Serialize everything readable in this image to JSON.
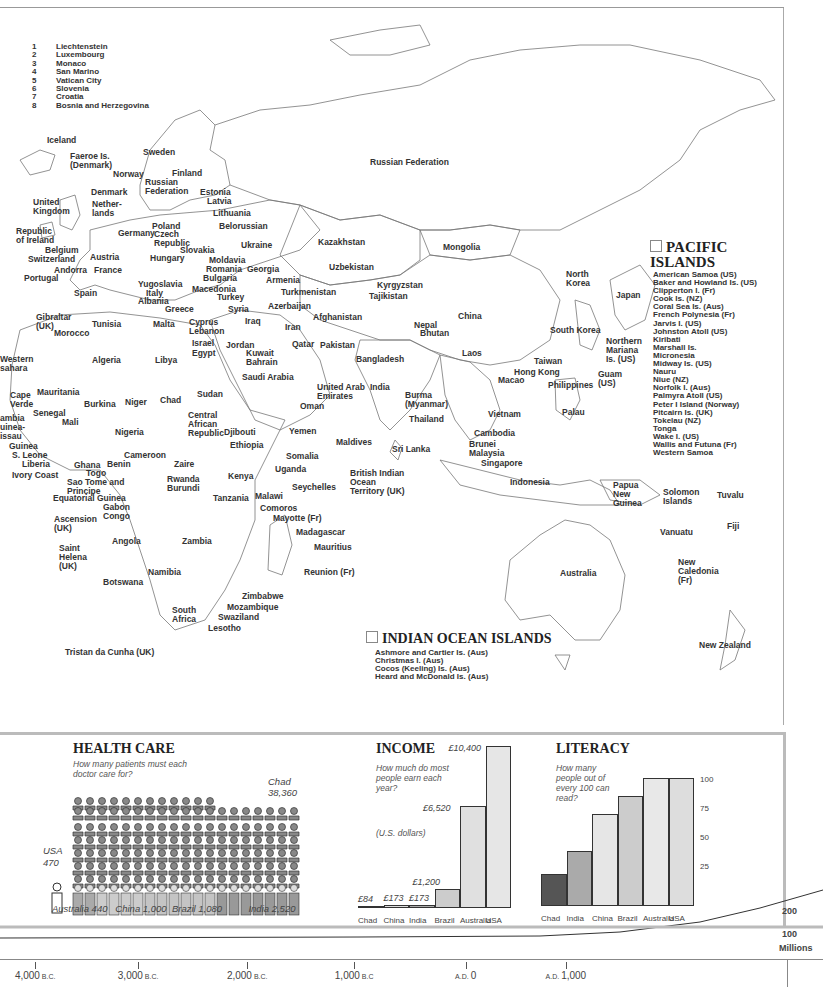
{
  "map": {
    "key_list": [
      {
        "num": "1",
        "name": "Liechtenstein"
      },
      {
        "num": "2",
        "name": "Luxembourg"
      },
      {
        "num": "3",
        "name": "Monaco"
      },
      {
        "num": "4",
        "name": "San Marino"
      },
      {
        "num": "5",
        "name": "Vatican City"
      },
      {
        "num": "6",
        "name": "Slovenia"
      },
      {
        "num": "7",
        "name": "Croatia"
      },
      {
        "num": "8",
        "name": "Bosnia and Herzegovina"
      }
    ],
    "labels": [
      {
        "t": "Iceland",
        "x": 47,
        "y": 136
      },
      {
        "t": "Faeroe Is.\n(Denmark)",
        "x": 70,
        "y": 152
      },
      {
        "t": "Sweden",
        "x": 143,
        "y": 148
      },
      {
        "t": "Norway",
        "x": 113,
        "y": 170
      },
      {
        "t": "Finland",
        "x": 172,
        "y": 169
      },
      {
        "t": "Russian\nFederation",
        "x": 145,
        "y": 178
      },
      {
        "t": "Estonia",
        "x": 200,
        "y": 188
      },
      {
        "t": "Denmark",
        "x": 91,
        "y": 188
      },
      {
        "t": "Latvia",
        "x": 207,
        "y": 197
      },
      {
        "t": "United\nKingdom",
        "x": 33,
        "y": 198
      },
      {
        "t": "Nether-\nlands",
        "x": 92,
        "y": 200
      },
      {
        "t": "Lithuania",
        "x": 213,
        "y": 209
      },
      {
        "t": "Poland",
        "x": 152,
        "y": 222
      },
      {
        "t": "Belorussian",
        "x": 219,
        "y": 222
      },
      {
        "t": "Republic\nof Ireland",
        "x": 16,
        "y": 227
      },
      {
        "t": "Germany",
        "x": 118,
        "y": 229
      },
      {
        "t": "Czech\nRepublic",
        "x": 154,
        "y": 230
      },
      {
        "t": "Belgium",
        "x": 45,
        "y": 246
      },
      {
        "t": "Slovakia",
        "x": 180,
        "y": 246
      },
      {
        "t": "Ukraine",
        "x": 241,
        "y": 241
      },
      {
        "t": "Switzerland",
        "x": 28,
        "y": 255
      },
      {
        "t": "Austria",
        "x": 90,
        "y": 253
      },
      {
        "t": "Hungary",
        "x": 150,
        "y": 254
      },
      {
        "t": "Moldavia",
        "x": 209,
        "y": 256
      },
      {
        "t": "Andorra",
        "x": 54,
        "y": 266
      },
      {
        "t": "France",
        "x": 94,
        "y": 266
      },
      {
        "t": "Romania",
        "x": 206,
        "y": 265
      },
      {
        "t": "Georgia",
        "x": 247,
        "y": 265
      },
      {
        "t": "Portugal",
        "x": 24,
        "y": 274
      },
      {
        "t": "Bulgaria",
        "x": 203,
        "y": 274
      },
      {
        "t": "Yugoslavia",
        "x": 138,
        "y": 280
      },
      {
        "t": "Armenia",
        "x": 266,
        "y": 276
      },
      {
        "t": "Macedonia",
        "x": 192,
        "y": 285
      },
      {
        "t": "Spain",
        "x": 74,
        "y": 289
      },
      {
        "t": "Italy",
        "x": 146,
        "y": 289
      },
      {
        "t": "Turkey",
        "x": 217,
        "y": 293
      },
      {
        "t": "Azerbaijan",
        "x": 268,
        "y": 302
      },
      {
        "t": "Albania",
        "x": 138,
        "y": 297
      },
      {
        "t": "Greece",
        "x": 165,
        "y": 305
      },
      {
        "t": "Syria",
        "x": 228,
        "y": 305
      },
      {
        "t": "Gibraltar\n(UK)",
        "x": 36,
        "y": 313
      },
      {
        "t": "Tunisia",
        "x": 92,
        "y": 320
      },
      {
        "t": "Malta",
        "x": 153,
        "y": 320
      },
      {
        "t": "Cyprus\nLebanon",
        "x": 189,
        "y": 318
      },
      {
        "t": "Iraq",
        "x": 245,
        "y": 317
      },
      {
        "t": "Morocco",
        "x": 54,
        "y": 329
      },
      {
        "t": "Israel",
        "x": 192,
        "y": 339
      },
      {
        "t": "Jordan",
        "x": 226,
        "y": 341
      },
      {
        "t": "Egypt",
        "x": 192,
        "y": 349
      },
      {
        "t": "Kuwait\nBahrain",
        "x": 246,
        "y": 349
      },
      {
        "t": "Western\nsahara",
        "x": 0,
        "y": 355
      },
      {
        "t": "Algeria",
        "x": 92,
        "y": 356
      },
      {
        "t": "Libya",
        "x": 155,
        "y": 356
      },
      {
        "t": "Saudi Arabia",
        "x": 242,
        "y": 373
      },
      {
        "t": "Mauritania",
        "x": 37,
        "y": 388
      },
      {
        "t": "Sudan",
        "x": 197,
        "y": 390
      },
      {
        "t": "Cape\nVerde",
        "x": 10,
        "y": 391
      },
      {
        "t": "Burkina",
        "x": 84,
        "y": 400
      },
      {
        "t": "Niger",
        "x": 125,
        "y": 398
      },
      {
        "t": "Chad",
        "x": 160,
        "y": 396
      },
      {
        "t": "Senegal",
        "x": 33,
        "y": 409
      },
      {
        "t": "ambia\nuinea-\nissau",
        "x": 0,
        "y": 414
      },
      {
        "t": "Mali",
        "x": 62,
        "y": 418
      },
      {
        "t": "Central\nAfrican\nRepublic",
        "x": 188,
        "y": 411
      },
      {
        "t": "Nigeria",
        "x": 115,
        "y": 428
      },
      {
        "t": "Djibouti",
        "x": 224,
        "y": 428
      },
      {
        "t": "Guinea",
        "x": 9,
        "y": 442
      },
      {
        "t": "Ethiopia",
        "x": 230,
        "y": 441
      },
      {
        "t": "S. Leone",
        "x": 12,
        "y": 451
      },
      {
        "t": "Cameroon",
        "x": 124,
        "y": 451
      },
      {
        "t": "Liberia",
        "x": 22,
        "y": 460
      },
      {
        "t": "Ghana",
        "x": 74,
        "y": 461
      },
      {
        "t": "Benin",
        "x": 107,
        "y": 460
      },
      {
        "t": "Zaire",
        "x": 174,
        "y": 460
      },
      {
        "t": "Ivory Coast",
        "x": 12,
        "y": 471
      },
      {
        "t": "Togo",
        "x": 86,
        "y": 469
      },
      {
        "t": "Sao Tome and\nPrincipe",
        "x": 67,
        "y": 478
      },
      {
        "t": "Rwanda\nBurundi",
        "x": 167,
        "y": 475
      },
      {
        "t": "Kenya",
        "x": 228,
        "y": 472
      },
      {
        "t": "Tanzania",
        "x": 213,
        "y": 494
      },
      {
        "t": "Malawi",
        "x": 255,
        "y": 492
      },
      {
        "t": "Equatorial Guinea",
        "x": 53,
        "y": 494
      },
      {
        "t": "Gabon\nCongo",
        "x": 103,
        "y": 503
      },
      {
        "t": "Comoros",
        "x": 260,
        "y": 504
      },
      {
        "t": "Mayotte (Fr)",
        "x": 273,
        "y": 514
      },
      {
        "t": "Ascension\n(UK)",
        "x": 54,
        "y": 515
      },
      {
        "t": "Angola",
        "x": 112,
        "y": 537
      },
      {
        "t": "Zambia",
        "x": 182,
        "y": 537
      },
      {
        "t": "Madagascar",
        "x": 296,
        "y": 528
      },
      {
        "t": "Mauritius",
        "x": 314,
        "y": 543
      },
      {
        "t": "Saint\nHelena\n(UK)",
        "x": 59,
        "y": 544
      },
      {
        "t": "Namibia",
        "x": 148,
        "y": 568
      },
      {
        "t": "Reunion (Fr)",
        "x": 304,
        "y": 568
      },
      {
        "t": "Botswana",
        "x": 103,
        "y": 578
      },
      {
        "t": "Zimbabwe",
        "x": 242,
        "y": 592
      },
      {
        "t": "South\nAfrica",
        "x": 172,
        "y": 606
      },
      {
        "t": "Mozambique",
        "x": 227,
        "y": 603
      },
      {
        "t": "Swaziland",
        "x": 218,
        "y": 613
      },
      {
        "t": "Lesotho",
        "x": 208,
        "y": 624
      },
      {
        "t": "Tristan da Cunha (UK)",
        "x": 65,
        "y": 648
      },
      {
        "t": "Russian Federation",
        "x": 370,
        "y": 158
      },
      {
        "t": "Kazakhstan",
        "x": 318,
        "y": 238
      },
      {
        "t": "Mongolia",
        "x": 443,
        "y": 243
      },
      {
        "t": "Uzbekistan",
        "x": 329,
        "y": 263
      },
      {
        "t": "Kyrgyzstan",
        "x": 377,
        "y": 281
      },
      {
        "t": "Turkmenistan",
        "x": 281,
        "y": 288
      },
      {
        "t": "Tajikistan",
        "x": 369,
        "y": 292
      },
      {
        "t": "Afghanistan",
        "x": 313,
        "y": 313
      },
      {
        "t": "Iran",
        "x": 285,
        "y": 323
      },
      {
        "t": "Qatar",
        "x": 292,
        "y": 340
      },
      {
        "t": "Pakistan",
        "x": 320,
        "y": 341
      },
      {
        "t": "Nepal",
        "x": 414,
        "y": 321
      },
      {
        "t": "Bhutan",
        "x": 420,
        "y": 329
      },
      {
        "t": "China",
        "x": 458,
        "y": 312
      },
      {
        "t": "Bangladesh",
        "x": 356,
        "y": 355
      },
      {
        "t": "India",
        "x": 370,
        "y": 383
      },
      {
        "t": "United Arab\nEmirates",
        "x": 317,
        "y": 383
      },
      {
        "t": "Oman",
        "x": 300,
        "y": 402
      },
      {
        "t": "Yemen",
        "x": 289,
        "y": 427
      },
      {
        "t": "Somalia",
        "x": 286,
        "y": 452
      },
      {
        "t": "Uganda",
        "x": 275,
        "y": 465
      },
      {
        "t": "Maldives",
        "x": 336,
        "y": 438
      },
      {
        "t": "Sri Lanka",
        "x": 392,
        "y": 445
      },
      {
        "t": "British Indian\nOcean\nTerritory (UK)",
        "x": 350,
        "y": 469
      },
      {
        "t": "Seychelles",
        "x": 292,
        "y": 483
      },
      {
        "t": "Burma\n(Myanmar)",
        "x": 405,
        "y": 391
      },
      {
        "t": "Thailand",
        "x": 409,
        "y": 415
      },
      {
        "t": "Laos",
        "x": 462,
        "y": 349
      },
      {
        "t": "Vietnam",
        "x": 488,
        "y": 410
      },
      {
        "t": "Cambodia",
        "x": 474,
        "y": 429
      },
      {
        "t": "Brunei\nMalaysia",
        "x": 469,
        "y": 440
      },
      {
        "t": "Singapore",
        "x": 481,
        "y": 459
      },
      {
        "t": "Indonesia",
        "x": 510,
        "y": 478
      },
      {
        "t": "North\nKorea",
        "x": 566,
        "y": 270
      },
      {
        "t": "Japan",
        "x": 616,
        "y": 291
      },
      {
        "t": "South Korea",
        "x": 550,
        "y": 326
      },
      {
        "t": "Taiwan",
        "x": 534,
        "y": 357
      },
      {
        "t": "Hong Kong",
        "x": 514,
        "y": 368
      },
      {
        "t": "Macao",
        "x": 498,
        "y": 376
      },
      {
        "t": "Philippines",
        "x": 548,
        "y": 381
      },
      {
        "t": "Northern\nMariana\nIs. (US)",
        "x": 606,
        "y": 337
      },
      {
        "t": "Guam\n(US)",
        "x": 598,
        "y": 370
      },
      {
        "t": "Palau",
        "x": 562,
        "y": 408
      },
      {
        "t": "Papua\nNew\nGuinea",
        "x": 613,
        "y": 481
      },
      {
        "t": "Solomon\nIslands",
        "x": 663,
        "y": 488
      },
      {
        "t": "Tuvalu",
        "x": 717,
        "y": 491
      },
      {
        "t": "Vanuatu",
        "x": 660,
        "y": 528
      },
      {
        "t": "Fiji",
        "x": 727,
        "y": 522
      },
      {
        "t": "New\nCaledonia\n(Fr)",
        "x": 678,
        "y": 558
      },
      {
        "t": "Australia",
        "x": 560,
        "y": 569
      },
      {
        "t": "New Zealand",
        "x": 699,
        "y": 641
      }
    ],
    "pacific": {
      "title_line1": "PACIFIC",
      "title_line2": "ISLANDS",
      "items": [
        "American Samoa (US)",
        "Baker and Howland Is. (US)",
        "Clipperton I. (Fr)",
        "Cook Is. (NZ)",
        "Coral Sea Is. (Aus)",
        "French Polynesia (Fr)",
        "Jarvis I. (US)",
        "Johnston Atoll (US)",
        "Kiribati",
        "Marshall Is.",
        "Micronesia",
        "Midway Is. (US)",
        "Nauru",
        "Niue (NZ)",
        "Norfolk I. (Aus)",
        "Palmyra Atoll (US)",
        "Peter I Island (Norway)",
        "Pitcairn Is. (UK)",
        "Tokelau (NZ)",
        "Tonga",
        "Wake I. (US)",
        "Wallis and Futuna (Fr)",
        "Western Samoa"
      ]
    },
    "indian_ocean": {
      "title": "INDIAN OCEAN ISLANDS",
      "items": [
        "Ashmore and Cartier Is. (Aus)",
        "Christmas I. (Aus)",
        "Cocos (Keeling) Is. (Aus)",
        "Heard and McDonald Is. (Aus)"
      ]
    }
  },
  "health": {
    "title": "HEALTH CARE",
    "question": "How many patients must each doctor   care for?",
    "label_chad": "Chad\n38,360",
    "label_usa": "USA\n470",
    "bottom_labels": "Australia 440   China 1,000  Brazil 1,080          India 2,520"
  },
  "income": {
    "title": "INCOME",
    "question": "How much do most people earn each year?",
    "unit": "(U.S. dollars)"
  },
  "literacy": {
    "title": "LITERACY",
    "question": "How many people out of every 100 can read?",
    "axis": [
      "100",
      "75",
      "50",
      "25"
    ]
  },
  "population": {
    "label_200": "200",
    "label_100": "100",
    "label_unit": "Millions",
    "ticks": [
      {
        "num": "4,000",
        "era": "B.C.",
        "x": 8
      },
      {
        "num": "3,000",
        "era": "B.C.",
        "x": 95
      },
      {
        "num": "2,000",
        "era": "B.C.",
        "x": 183
      },
      {
        "num": "1,000",
        "era": "B.C",
        "x": 270
      },
      {
        "num": "0",
        "era": "A.D.",
        "x": 367,
        "era_first": true
      },
      {
        "num": "1,000",
        "era": "A.D.",
        "x": 440,
        "era_first": true
      }
    ]
  },
  "chart_data": [
    {
      "type": "bar",
      "title": "HEALTH CARE",
      "subtitle": "How many patients must each doctor care for?",
      "categories": [
        "USA",
        "Australia",
        "China",
        "Brazil",
        "India",
        "Chad"
      ],
      "values": [
        470,
        440,
        1000,
        1080,
        2520,
        38360
      ],
      "ylabel": "Patients per doctor",
      "style": "pictogram"
    },
    {
      "type": "bar",
      "title": "INCOME",
      "subtitle": "How much do most people earn each year? (U.S. dollars)",
      "categories": [
        "Chad",
        "China",
        "India",
        "Brazil",
        "Australia",
        "USA"
      ],
      "values": [
        84,
        173,
        173,
        1200,
        6520,
        10400
      ],
      "value_labels": [
        "£84",
        "£173",
        "£173",
        "£1,200",
        "£6,520",
        "£10,400"
      ],
      "colors": [
        "#555555",
        "#dddddd",
        "#aaaaaa",
        "#cccccc",
        "#e0e0e0",
        "#e6e6e6"
      ]
    },
    {
      "type": "bar",
      "title": "LITERACY",
      "subtitle": "How many people out of every 100 can read?",
      "categories": [
        "Chad",
        "India",
        "China",
        "Brazil",
        "Australia",
        "USA"
      ],
      "values": [
        25,
        43,
        72,
        86,
        100,
        100
      ],
      "yticks": [
        25,
        50,
        75,
        100
      ],
      "ylim": [
        0,
        100
      ],
      "colors": [
        "#555555",
        "#aaaaaa",
        "#e6e6e6",
        "#cccccc",
        "#e8e8e8",
        "#dddddd"
      ]
    },
    {
      "type": "area",
      "title": "World population",
      "x": [
        "4,000 B.C.",
        "3,000 B.C.",
        "2,000 B.C.",
        "1,000 B.C",
        "A.D. 0",
        "A.D. 1,000"
      ],
      "ylabel": "Millions",
      "yticks": [
        100,
        200
      ],
      "values": [
        7,
        14,
        27,
        50,
        200,
        275
      ]
    }
  ]
}
